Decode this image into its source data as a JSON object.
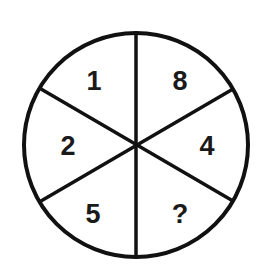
{
  "puzzle": {
    "segments": [
      {
        "position": "top-left",
        "value": "1"
      },
      {
        "position": "top-right",
        "value": "8"
      },
      {
        "position": "middle-left",
        "value": "2"
      },
      {
        "position": "middle-right",
        "value": "4"
      },
      {
        "position": "bottom-left",
        "value": "5"
      },
      {
        "position": "bottom-right",
        "value": "?"
      }
    ],
    "colors": {
      "stroke": "#111111",
      "background": "#ffffff"
    }
  }
}
